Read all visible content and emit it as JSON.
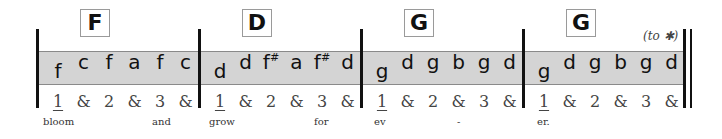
{
  "measures": [
    {
      "chord": "F",
      "notes": [
        "f",
        "c",
        "f",
        "a",
        "f",
        "c"
      ],
      "counts": [
        "1",
        "&",
        "2",
        "&",
        "3",
        "&"
      ],
      "lyrics": [
        {
          "text": "bloom",
          "x": 43
        },
        {
          "text": "and",
          "x": 152
        }
      ]
    },
    {
      "chord": "D",
      "notes": [
        "d",
        "d",
        "f#",
        "a",
        "f#",
        "d"
      ],
      "counts": [
        "1",
        "&",
        "2",
        "&",
        "3",
        "&"
      ],
      "lyrics": [
        {
          "text": "grow",
          "x": 209
        },
        {
          "text": "for",
          "x": 314
        }
      ]
    },
    {
      "chord": "G",
      "notes": [
        "g",
        "d",
        "g",
        "b",
        "g",
        "d"
      ],
      "counts": [
        "1",
        "&",
        "2",
        "&",
        "3",
        "&"
      ],
      "lyrics": [
        {
          "text": "ev",
          "x": 374
        },
        {
          "text": "-",
          "x": 457
        }
      ]
    },
    {
      "chord": "G",
      "notes": [
        "g",
        "d",
        "g",
        "b",
        "g",
        "d"
      ],
      "counts": [
        "1",
        "&",
        "2",
        "&",
        "3",
        "&"
      ],
      "lyrics": [
        {
          "text": "er.",
          "x": 537
        }
      ]
    }
  ],
  "to_coda": "(to ✱)",
  "colors": {
    "band": "#d4d4d4",
    "barline": "#111111"
  }
}
